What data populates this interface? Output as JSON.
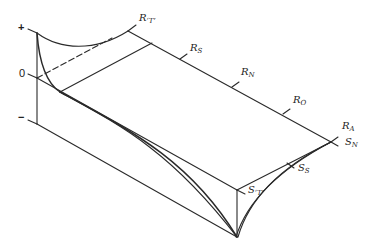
{
  "diagram": {
    "type": "3d-surface-sketch",
    "axis": {
      "plus": "+",
      "zero": "0",
      "minus": "−"
    },
    "labels": {
      "r_t": {
        "main": "R",
        "sub": "‘T’"
      },
      "r_s": {
        "main": "R",
        "sub": "S"
      },
      "r_n": {
        "main": "R",
        "sub": "N"
      },
      "r_o": {
        "main": "R",
        "sub": "O"
      },
      "r_a": {
        "main": "R",
        "sub": "A"
      },
      "s_n": {
        "main": "S",
        "sub": "N"
      },
      "s_s": {
        "main": "S",
        "sub": "S"
      },
      "s_t": {
        "main": "S",
        "sub": "‘T’"
      }
    },
    "colors": {
      "line": "#2a2a2a",
      "background": "#ffffff"
    }
  }
}
